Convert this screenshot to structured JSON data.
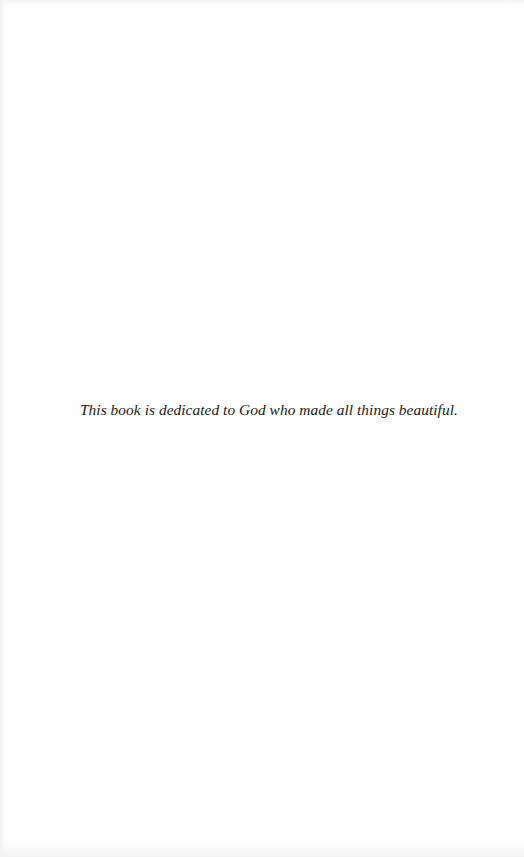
{
  "page": {
    "type": "dedication",
    "dedication_text": "This book is dedicated to God who made all things beautiful."
  }
}
